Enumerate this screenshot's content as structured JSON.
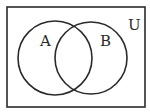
{
  "diagram": {
    "type": "venn",
    "universe_label": "U",
    "sets": [
      {
        "label": "A"
      },
      {
        "label": "B"
      }
    ],
    "stroke_color": "#2a2a2a",
    "background": "#ffffff"
  }
}
